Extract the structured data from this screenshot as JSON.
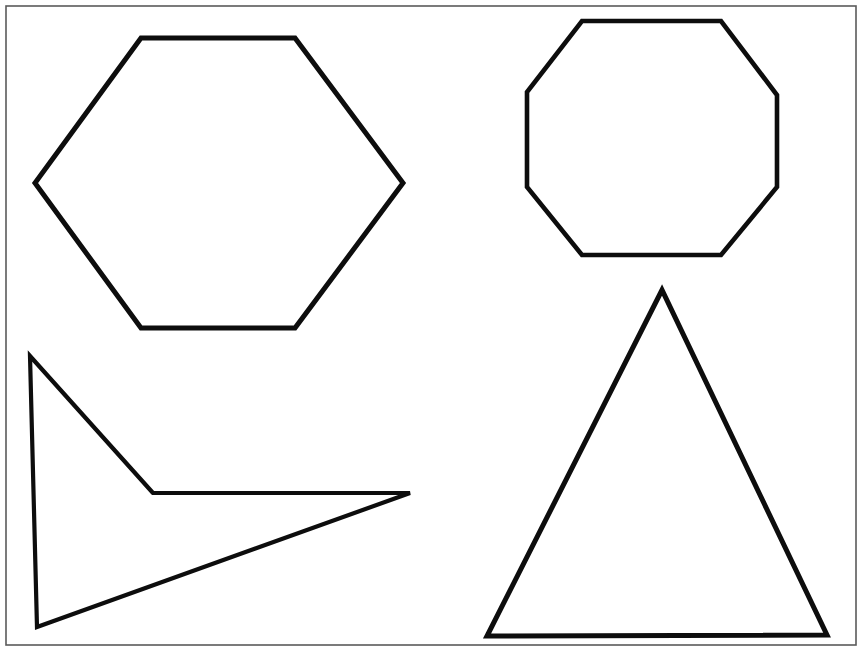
{
  "page": {
    "width": 864,
    "height": 657,
    "background_color": "#ffffff"
  },
  "frame": {
    "name": "page-border",
    "x": 6,
    "y": 6,
    "width": 850,
    "height": 639,
    "stroke_color": "#5a5a5a",
    "stroke_width": 1.6,
    "fill": "none"
  },
  "shapes": [
    {
      "id": "hexagon",
      "label": "hexagon",
      "sides": 6,
      "stroke_color": "#0d0d0d",
      "stroke_width": 5,
      "fill": "none",
      "points": "141,38 295,38 403,183 295,328 141,328 35,183",
      "quadrant": "top-left"
    },
    {
      "id": "octagon",
      "label": "octagon",
      "sides": 8,
      "stroke_color": "#0d0d0d",
      "stroke_width": 4.6,
      "fill": "none",
      "points": "582,21 721,21 777,95 777,187 721,255 582,255 527,187 527,92",
      "quadrant": "top-right"
    },
    {
      "id": "arrow",
      "label": "concave arrowhead",
      "sides": 4,
      "stroke_color": "#0d0d0d",
      "stroke_width": 4.2,
      "fill": "none",
      "points": "30,356 153,493 410,493 37,627",
      "quadrant": "bottom-left"
    },
    {
      "id": "triangle",
      "label": "triangle",
      "sides": 3,
      "stroke_color": "#0d0d0d",
      "stroke_width": 5,
      "fill": "none",
      "points": "662,290 827,635 487,636",
      "quadrant": "bottom-right"
    }
  ],
  "chart_data": {
    "type": "diagram",
    "title": "",
    "items": [
      {
        "name": "hexagon",
        "vertices": 6,
        "position": "top-left"
      },
      {
        "name": "octagon",
        "vertices": 8,
        "position": "top-right"
      },
      {
        "name": "arrowhead",
        "vertices": 4,
        "position": "bottom-left"
      },
      {
        "name": "triangle",
        "vertices": 3,
        "position": "bottom-right"
      }
    ]
  }
}
